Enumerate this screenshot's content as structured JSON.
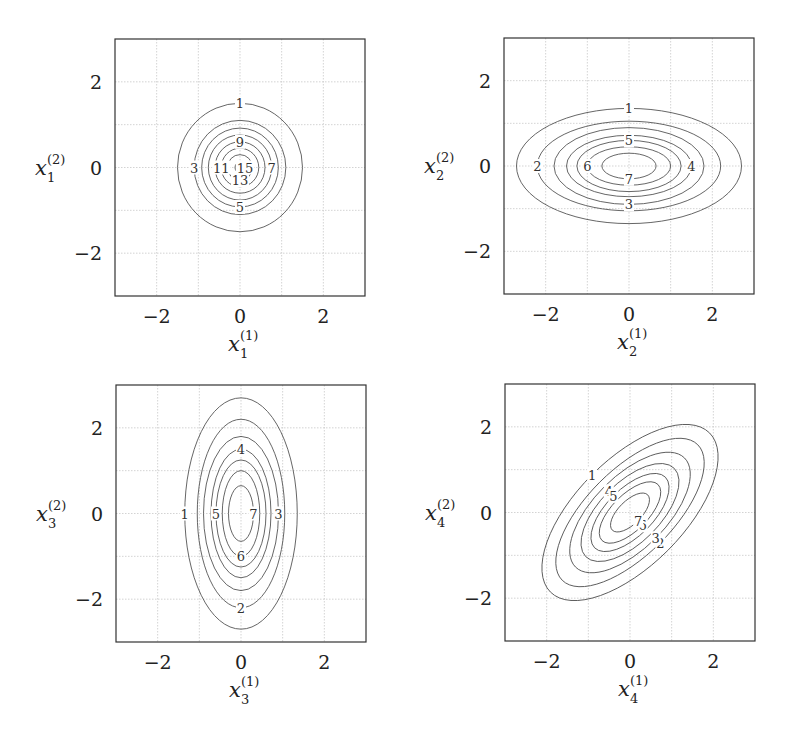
{
  "chart_data": [
    {
      "type": "contour",
      "title": "",
      "xlabel": "x_1^{(1)}",
      "ylabel": "x_1^{(2)}",
      "xlabel_parts": {
        "base": "x",
        "sub": "1",
        "sup": "(1)"
      },
      "ylabel_parts": {
        "base": "x",
        "sub": "1",
        "sup": "(2)"
      },
      "xlim": [
        -3,
        3
      ],
      "ylim": [
        -3,
        3
      ],
      "xticks": [
        -2,
        0,
        2
      ],
      "yticks": [
        -2,
        0,
        2
      ],
      "grid": true,
      "frame": {
        "left": 115,
        "top": 39,
        "right": 365,
        "bottom": 296
      },
      "shape": "circle",
      "rotation_deg": 0,
      "contours": [
        {
          "level": 1,
          "rx": 1.5,
          "ry": 1.5,
          "label_pos": "top"
        },
        {
          "level": 3,
          "rx": 1.1,
          "ry": 1.1,
          "label_pos": "left"
        },
        {
          "level": 5,
          "rx": 0.92,
          "ry": 0.92,
          "label_pos": "bottom"
        },
        {
          "level": 7,
          "rx": 0.76,
          "ry": 0.76,
          "label_pos": "right"
        },
        {
          "level": 9,
          "rx": 0.6,
          "ry": 0.6,
          "label_pos": "top"
        },
        {
          "level": 11,
          "rx": 0.45,
          "ry": 0.45,
          "label_pos": "left"
        },
        {
          "level": 13,
          "rx": 0.3,
          "ry": 0.3,
          "label_pos": "bottom"
        },
        {
          "level": 15,
          "rx": 0.12,
          "ry": 0.12,
          "label_pos": "right"
        }
      ]
    },
    {
      "type": "contour",
      "title": "",
      "xlabel": "x_2^{(1)}",
      "ylabel": "x_2^{(2)}",
      "xlabel_parts": {
        "base": "x",
        "sub": "2",
        "sup": "(1)"
      },
      "ylabel_parts": {
        "base": "x",
        "sub": "2",
        "sup": "(2)"
      },
      "xlim": [
        -3,
        3
      ],
      "ylim": [
        -3,
        3
      ],
      "xticks": [
        -2,
        0,
        2
      ],
      "yticks": [
        -2,
        0,
        2
      ],
      "grid": true,
      "frame": {
        "left": 504,
        "top": 38,
        "right": 754,
        "bottom": 294
      },
      "shape": "ellipse-horizontal",
      "rotation_deg": 0,
      "contours": [
        {
          "level": 1,
          "rx": 2.7,
          "ry": 1.35,
          "label_pos": "top"
        },
        {
          "level": 2,
          "rx": 2.2,
          "ry": 1.05,
          "label_pos": "left"
        },
        {
          "level": 3,
          "rx": 1.8,
          "ry": 0.9,
          "label_pos": "bottom"
        },
        {
          "level": 4,
          "rx": 1.5,
          "ry": 0.72,
          "label_pos": "right"
        },
        {
          "level": 5,
          "rx": 1.25,
          "ry": 0.6,
          "label_pos": "top"
        },
        {
          "level": 6,
          "rx": 1.0,
          "ry": 0.45,
          "label_pos": "left"
        },
        {
          "level": 7,
          "rx": 0.65,
          "ry": 0.3,
          "label_pos": "bottom"
        }
      ]
    },
    {
      "type": "contour",
      "title": "",
      "xlabel": "x_3^{(1)}",
      "ylabel": "x_3^{(2)}",
      "xlabel_parts": {
        "base": "x",
        "sub": "3",
        "sup": "(1)"
      },
      "ylabel_parts": {
        "base": "x",
        "sub": "3",
        "sup": "(2)"
      },
      "xlim": [
        -3,
        3
      ],
      "ylim": [
        -3,
        3
      ],
      "xticks": [
        -2,
        0,
        2
      ],
      "yticks": [
        -2,
        0,
        2
      ],
      "grid": true,
      "frame": {
        "left": 116,
        "top": 385,
        "right": 366,
        "bottom": 642
      },
      "shape": "ellipse-vertical",
      "rotation_deg": 0,
      "contours": [
        {
          "level": 1,
          "rx": 1.35,
          "ry": 2.7,
          "label_pos": "left"
        },
        {
          "level": 2,
          "rx": 1.05,
          "ry": 2.2,
          "label_pos": "bottom"
        },
        {
          "level": 3,
          "rx": 0.9,
          "ry": 1.8,
          "label_pos": "right"
        },
        {
          "level": 4,
          "rx": 0.72,
          "ry": 1.5,
          "label_pos": "top"
        },
        {
          "level": 5,
          "rx": 0.6,
          "ry": 1.25,
          "label_pos": "left"
        },
        {
          "level": 6,
          "rx": 0.45,
          "ry": 1.0,
          "label_pos": "bottom"
        },
        {
          "level": 7,
          "rx": 0.3,
          "ry": 0.65,
          "label_pos": "right"
        }
      ]
    },
    {
      "type": "contour",
      "title": "",
      "xlabel": "x_4^{(1)}",
      "ylabel": "x_4^{(2)}",
      "xlabel_parts": {
        "base": "x",
        "sub": "4",
        "sup": "(1)"
      },
      "ylabel_parts": {
        "base": "x",
        "sub": "4",
        "sup": "(2)"
      },
      "xlim": [
        -3,
        3
      ],
      "ylim": [
        -3,
        3
      ],
      "xticks": [
        -2,
        0,
        2
      ],
      "yticks": [
        -2,
        0,
        2
      ],
      "grid": true,
      "frame": {
        "left": 505,
        "top": 384,
        "right": 755,
        "bottom": 641
      },
      "shape": "ellipse-rotated",
      "rotation_deg": 45,
      "contours": [
        {
          "level": 1,
          "rx": 2.7,
          "ry": 1.25,
          "label_pos": "top"
        },
        {
          "level": 2,
          "rx": 2.3,
          "ry": 1.0,
          "label_pos": "bottom"
        },
        {
          "level": 3,
          "rx": 1.85,
          "ry": 0.85,
          "label_pos": "bottom"
        },
        {
          "level": 4,
          "rx": 1.5,
          "ry": 0.7,
          "label_pos": "top"
        },
        {
          "level": 5,
          "rx": 1.2,
          "ry": 0.55,
          "label_pos": "top"
        },
        {
          "level": 6,
          "rx": 0.95,
          "ry": 0.42,
          "label_pos": "bottom"
        },
        {
          "level": 7,
          "rx": 0.6,
          "ry": 0.27,
          "label_pos": "bottom"
        }
      ]
    }
  ]
}
